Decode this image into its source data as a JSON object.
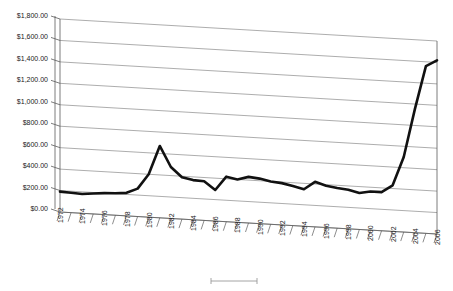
{
  "chart_data": {
    "type": "line",
    "title": "",
    "subtitle": "",
    "xlabel": "",
    "ylabel": "",
    "grid": true,
    "legend_position": "bottom",
    "legend_entries": [
      ""
    ],
    "xlim": [
      1972,
      2006
    ],
    "ylim": [
      0,
      1800
    ],
    "y_tick_step": 200,
    "y_ticks": [
      0,
      200,
      400,
      600,
      800,
      1000,
      1200,
      1400,
      1600,
      1800
    ],
    "y_tick_labels": [
      "$0.00",
      "$200.00",
      "$400.00",
      "$600.00",
      "$800.00",
      "$1,000.00",
      "$1,200.00",
      "$1,400.00",
      "$1,600.00",
      "$1,800.00"
    ],
    "x_tick_labels": [
      "1972",
      "1974",
      "1976",
      "1978",
      "1980",
      "1982",
      "1984",
      "1986",
      "1988",
      "1990",
      "1992",
      "1994",
      "1996",
      "1998",
      "2000",
      "2002",
      "2004",
      "2006"
    ],
    "x": [
      1972,
      1973,
      1974,
      1975,
      1976,
      1977,
      1978,
      1979,
      1980,
      1981,
      1982,
      1983,
      1984,
      1985,
      1986,
      1987,
      1988,
      1989,
      1990,
      1991,
      1992,
      1993,
      1994,
      1995,
      1996,
      1997,
      1998,
      1999,
      2000,
      2001,
      2002,
      2003,
      2004,
      2005,
      2006
    ],
    "values": [
      190,
      185,
      180,
      190,
      200,
      205,
      215,
      260,
      400,
      670,
      480,
      390,
      370,
      365,
      290,
      420,
      400,
      430,
      420,
      400,
      390,
      370,
      345,
      420,
      390,
      375,
      365,
      340,
      360,
      360,
      430,
      700,
      1150,
      1560,
      1620
    ],
    "series": [
      {
        "name": "",
        "color": "#111111",
        "values": [
          190,
          185,
          180,
          190,
          200,
          205,
          215,
          260,
          400,
          670,
          480,
          390,
          370,
          365,
          290,
          420,
          400,
          430,
          420,
          400,
          390,
          370,
          345,
          420,
          390,
          375,
          365,
          340,
          360,
          360,
          430,
          700,
          1150,
          1560,
          1620
        ]
      }
    ],
    "style": {
      "perspective_3d": true,
      "gridline_color": "#8a8a8a",
      "axis_color": "#5a5a5a",
      "line_color": "#111111",
      "line_width": 2.6,
      "plot_background": "#ffffff"
    }
  }
}
